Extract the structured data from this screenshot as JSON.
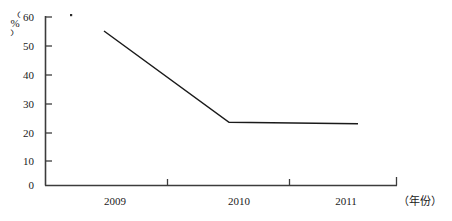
{
  "chart_data": {
    "type": "line",
    "title": "",
    "xlabel": "（年份）",
    "ylabel": "（%）",
    "categories": [
      "2009",
      "2010",
      "2011"
    ],
    "x": [
      2009,
      2010,
      2011
    ],
    "series": [
      {
        "name": "",
        "values": [
          55,
          22.5,
          22
        ]
      }
    ],
    "yticks": [
      "0",
      "10",
      "20",
      "30",
      "40",
      "50",
      "60"
    ],
    "ytick_values": [
      0,
      10,
      20,
      30,
      40,
      50,
      60
    ],
    "ylim": [
      0,
      60
    ],
    "xticks": [
      "2009",
      "2010",
      "2011"
    ],
    "grid": false,
    "legend": null,
    "line_color": "#1a1a1a",
    "background_color": "#ffffff",
    "axis_color": "#4a4a4a"
  },
  "axis": {
    "y_title_paren_open": "（",
    "y_title_symbol": "%",
    "y_title_paren_close": "）",
    "x_title": "（年份）"
  },
  "y_labels": {
    "t0": "0",
    "t10": "10",
    "t20": "20",
    "t30": "30",
    "t40": "40",
    "t50": "50",
    "t60": "60"
  },
  "x_labels": {
    "y2009": "2009",
    "y2010": "2010",
    "y2011": "2011"
  }
}
